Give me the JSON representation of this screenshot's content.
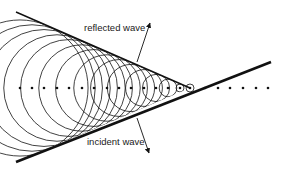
{
  "diagram": {
    "labels": {
      "reflected": "reflected wave",
      "incident": "incident wave"
    },
    "colors": {
      "ink": "#111111",
      "background": "#ffffff"
    },
    "axis_y": 88,
    "apex": {
      "x": 190,
      "y": 88
    },
    "dots_x": [
      20,
      32,
      44,
      57,
      69,
      82,
      94,
      107,
      119,
      131,
      144,
      156,
      168,
      180,
      190,
      205,
      218,
      230,
      243,
      256,
      268
    ],
    "reflected_line": {
      "x1": 16,
      "y1": 12,
      "x2": 190,
      "y2": 88
    },
    "incident_line": {
      "x1": 16,
      "y1": 162,
      "x2": 271,
      "y2": 62
    },
    "reflected_arrow": {
      "x1": 137,
      "y1": 62,
      "x2": 150,
      "y2": 23
    },
    "incident_arrow": {
      "x1": 137,
      "y1": 118,
      "x2": 149,
      "y2": 153
    }
  }
}
